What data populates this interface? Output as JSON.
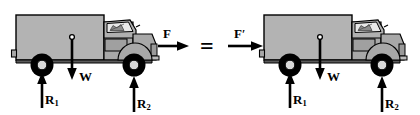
{
  "figure": {
    "type": "free-body-diagram",
    "title": "",
    "relation_symbol": "="
  },
  "colors": {
    "body_fill": "#b3b3b3",
    "body_stroke": "#000000",
    "cab_fill": "#a8a8a8",
    "glass_fill": "#e8e8e8",
    "tire_fill": "#000000",
    "hub_fill": "#d8d8d8",
    "arrow_color": "#000000",
    "background": "#ffffff"
  },
  "panels": [
    {
      "id": "left",
      "name": "truck-pulled-at-front",
      "forces": [
        {
          "id": "F",
          "label": "F",
          "prime": false,
          "direction": "right",
          "kind": "applied",
          "attach": "front-bumper"
        },
        {
          "id": "W",
          "label": "W",
          "prime": false,
          "direction": "down",
          "kind": "weight",
          "attach": "center-of-gravity"
        },
        {
          "id": "R1",
          "label": "R",
          "subscript": "1",
          "prime": false,
          "direction": "up",
          "kind": "reaction",
          "attach": "rear-wheel"
        },
        {
          "id": "R2",
          "label": "R",
          "subscript": "2",
          "prime": false,
          "direction": "up",
          "kind": "reaction",
          "attach": "front-wheel"
        }
      ]
    },
    {
      "id": "right",
      "name": "truck-pushed-at-rear",
      "forces": [
        {
          "id": "Fp",
          "label": "F",
          "prime": true,
          "direction": "right",
          "kind": "applied",
          "attach": "rear-bumper"
        },
        {
          "id": "W",
          "label": "W",
          "prime": false,
          "direction": "down",
          "kind": "weight",
          "attach": "center-of-gravity"
        },
        {
          "id": "R1",
          "label": "R",
          "subscript": "1",
          "prime": false,
          "direction": "up",
          "kind": "reaction",
          "attach": "rear-wheel"
        },
        {
          "id": "R2",
          "label": "R",
          "subscript": "2",
          "prime": false,
          "direction": "up",
          "kind": "reaction",
          "attach": "front-wheel"
        }
      ]
    }
  ],
  "labels": {
    "left_F": "F",
    "left_W": "W",
    "left_R1": "R",
    "left_R1_sub": "1",
    "left_R2": "R",
    "left_R2_sub": "2",
    "equals": "=",
    "right_F": "F",
    "right_F_prime": "′",
    "right_W": "W",
    "right_R1": "R",
    "right_R1_sub": "1",
    "right_R2": "R",
    "right_R2_sub": "2"
  }
}
